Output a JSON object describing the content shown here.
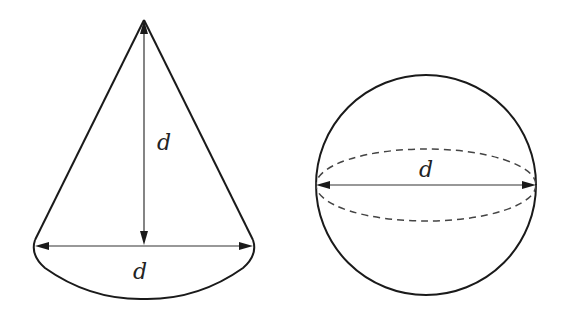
{
  "diagram": {
    "figures": [
      {
        "id": "cone",
        "description": "Cone with height d and base diameter d",
        "labels": {
          "height": "d",
          "base_diameter": "d"
        }
      },
      {
        "id": "sphere",
        "description": "Sphere with diameter d and dashed equatorial ellipse",
        "labels": {
          "diameter": "d"
        }
      }
    ]
  }
}
